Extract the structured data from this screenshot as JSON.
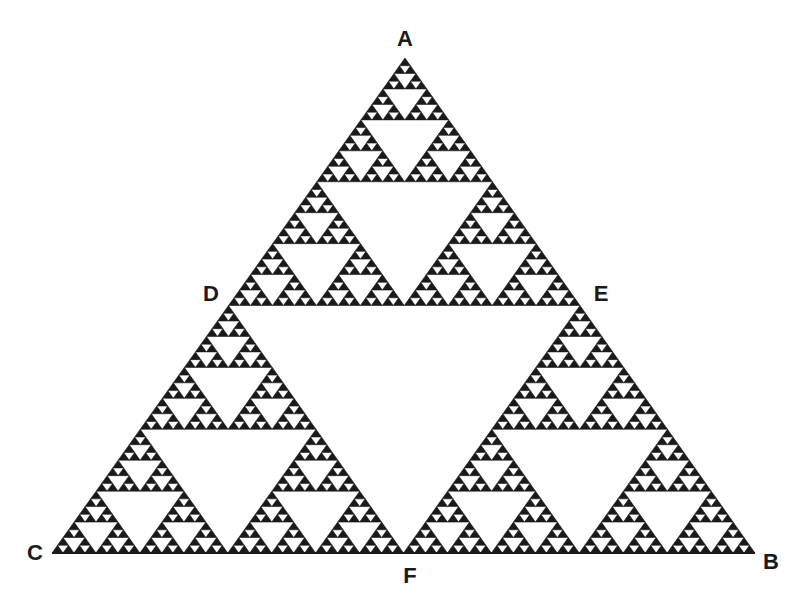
{
  "diagram": {
    "type": "sierpinski-triangle",
    "depth": 6,
    "fill_color": "#1a1a1a",
    "background_color": "#ffffff",
    "outer_triangle": {
      "apex": [
        405,
        58
      ],
      "bottom_left": [
        52,
        553
      ],
      "bottom_right": [
        755,
        553
      ]
    },
    "labels": [
      {
        "id": "A",
        "text": "A",
        "x": 405,
        "y": 39
      },
      {
        "id": "B",
        "text": "B",
        "x": 771,
        "y": 562
      },
      {
        "id": "C",
        "text": "C",
        "x": 35,
        "y": 553
      },
      {
        "id": "D",
        "text": "D",
        "x": 211,
        "y": 294
      },
      {
        "id": "E",
        "text": "E",
        "x": 601,
        "y": 294
      },
      {
        "id": "F",
        "text": "F",
        "x": 410,
        "y": 576
      }
    ]
  }
}
